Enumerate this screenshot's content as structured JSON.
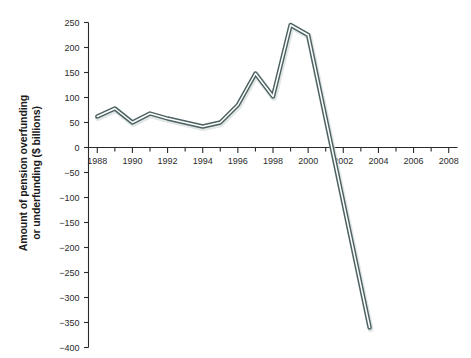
{
  "chart_data": {
    "type": "line",
    "title": "",
    "subtitle": "",
    "xlabel": "",
    "ylabel": "Amount of pension overfunding or underfunding ($ billions)",
    "ylabel_line1": "Amount of pension overfunding",
    "ylabel_line2": "or underfunding ($ billions)",
    "xlim": [
      1987.5,
      2008.5
    ],
    "ylim": [
      -400,
      250
    ],
    "yticks": [
      250,
      200,
      150,
      100,
      50,
      0,
      -50,
      -100,
      -150,
      -200,
      -250,
      -300,
      -350,
      -400
    ],
    "ytick_labels": [
      "250",
      "200",
      "150",
      "100",
      "50",
      "0",
      "−50",
      "−100",
      "−150",
      "−200",
      "−250",
      "−300",
      "−350",
      "−400"
    ],
    "xticks_major": [
      1988,
      1990,
      1992,
      1994,
      1996,
      1998,
      2000,
      2002,
      2004,
      2006,
      2008
    ],
    "xtick_labels": [
      "1988",
      "1990",
      "1992",
      "1994",
      "1996",
      "1998",
      "2000",
      "2002",
      "2004",
      "2006",
      "2008"
    ],
    "xticks_minor": [
      1989,
      1991,
      1993,
      1995,
      1997,
      1999,
      2001,
      2003,
      2005,
      2007
    ],
    "grid": false,
    "legend": false,
    "legend_position": "none",
    "line_color": "#4c6161",
    "line_highlight_color": "#ffffff",
    "axis_color": "#2b2b2b",
    "series": [
      {
        "name": "Pension funding status",
        "x": [
          1988,
          1989,
          1990,
          1991,
          1992,
          1993,
          1994,
          1995,
          1996,
          1997,
          1998,
          1999,
          2000,
          2003.5
        ],
        "values": [
          62,
          78,
          50,
          68,
          58,
          50,
          42,
          50,
          85,
          148,
          102,
          245,
          225,
          -360
        ]
      }
    ],
    "annotations": []
  }
}
